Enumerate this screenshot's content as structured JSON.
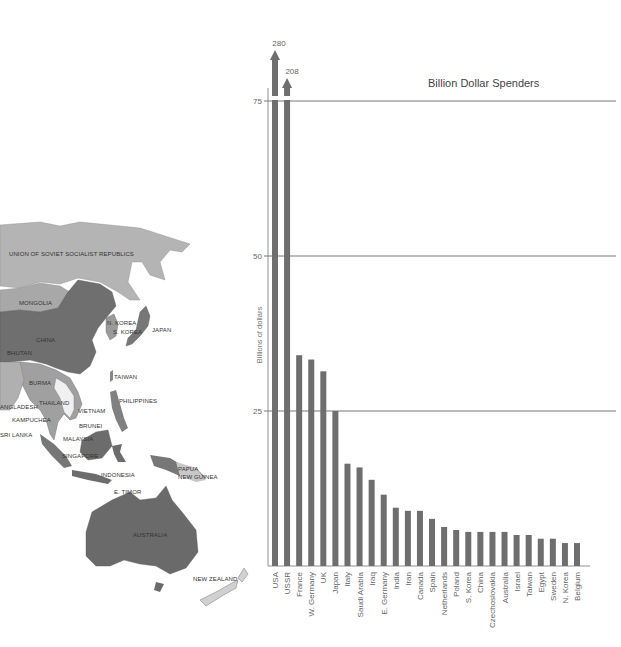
{
  "chart_data": {
    "type": "bar",
    "title": "Billion Dollar Spenders",
    "xlabel": "",
    "ylabel": "Billions of dollars",
    "ylim": [
      0,
      75
    ],
    "yticks": [
      25,
      50,
      75
    ],
    "grid": "horizontal at ticks",
    "legend": "none",
    "categories": [
      "USA",
      "USSR",
      "France",
      "W. Germany",
      "UK",
      "Japan",
      "Italy",
      "Saudi Arabia",
      "Iraq",
      "E. Germany",
      "India",
      "Iran",
      "Canada",
      "Spain",
      "Netherlands",
      "Poland",
      "S. Korea",
      "China",
      "Czechoslovakia",
      "Australia",
      "Israel",
      "Taiwan",
      "Egypt",
      "Sweden",
      "N. Korea",
      "Belgium"
    ],
    "values": [
      280,
      208,
      34,
      33.3,
      31.4,
      25,
      16.5,
      15.9,
      13.9,
      11.5,
      9.4,
      8.9,
      8.9,
      7.6,
      6.3,
      5.8,
      5.5,
      5.5,
      5.5,
      5.5,
      5.0,
      5.0,
      4.4,
      4.4,
      3.7,
      3.7
    ],
    "annotations": [
      {
        "category": "USA",
        "text": "280",
        "note": "bar exceeds axis, shown with arrow"
      },
      {
        "category": "USSR",
        "text": "208",
        "note": "bar exceeds axis, shown with arrow"
      }
    ],
    "bar_color": "#6e6e6e"
  },
  "map": {
    "labels": [
      {
        "id": "ussr",
        "text": "UNION OF SOVIET SOCIALIST REPUBLICS",
        "x": 9,
        "y": 256
      },
      {
        "id": "mongolia",
        "text": "MONGOLIA",
        "x": 19,
        "y": 305
      },
      {
        "id": "china",
        "text": "CHINA",
        "x": 36,
        "y": 342
      },
      {
        "id": "bhutan",
        "text": "BHUTAN",
        "x": 7,
        "y": 355
      },
      {
        "id": "n-korea",
        "text": "N. KOREA",
        "x": 107,
        "y": 325
      },
      {
        "id": "s-korea",
        "text": "S. KOREA",
        "x": 113,
        "y": 334
      },
      {
        "id": "japan",
        "text": "JAPAN",
        "x": 152,
        "y": 332
      },
      {
        "id": "taiwan",
        "text": "TAIWAN",
        "x": 114,
        "y": 379
      },
      {
        "id": "burma",
        "text": "BURMA",
        "x": 29,
        "y": 385
      },
      {
        "id": "thailand",
        "text": "THAILAND",
        "x": 39,
        "y": 405
      },
      {
        "id": "bangladesh",
        "text": "ANGLADESH",
        "x": 0,
        "y": 409
      },
      {
        "id": "philippines",
        "text": "PHILIPPINES",
        "x": 119,
        "y": 403
      },
      {
        "id": "vietnam",
        "text": "VIETNAM",
        "x": 78,
        "y": 413
      },
      {
        "id": "kampuchea",
        "text": "KAMPUCHEA",
        "x": 12,
        "y": 422
      },
      {
        "id": "brunei",
        "text": "BRUNEI",
        "x": 79,
        "y": 428
      },
      {
        "id": "sri-lanka",
        "text": "SRI LANKA",
        "x": 0,
        "y": 437
      },
      {
        "id": "malaysia",
        "text": "MALAYSIA",
        "x": 63,
        "y": 441
      },
      {
        "id": "singapore",
        "text": "SINGAPORE",
        "x": 62,
        "y": 458
      },
      {
        "id": "indonesia",
        "text": "INDONESIA",
        "x": 101,
        "y": 477
      },
      {
        "id": "papua",
        "text": "PAPUA",
        "x": 178,
        "y": 471
      },
      {
        "id": "new-guinea",
        "text": "NEW GUINEA",
        "x": 178,
        "y": 479
      },
      {
        "id": "e-timor",
        "text": "E. TIMOR",
        "x": 114,
        "y": 494
      },
      {
        "id": "australia",
        "text": "AUSTRALIA",
        "x": 133,
        "y": 537
      },
      {
        "id": "new-zealand",
        "text": "NEW ZEALAND",
        "x": 193,
        "y": 581
      }
    ]
  }
}
